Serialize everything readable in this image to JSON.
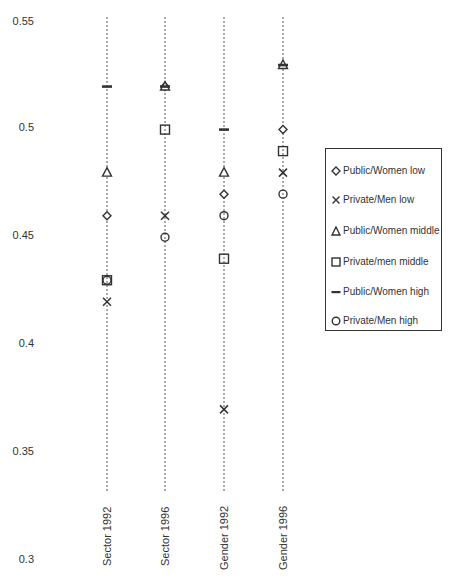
{
  "chart_data": {
    "type": "scatter",
    "title": "",
    "xlabel": "",
    "ylabel": "",
    "ylim": [
      0.3,
      0.55
    ],
    "yticks": [
      "0.55",
      "0.5",
      "0.45",
      "0.4",
      "0.35",
      "0.3"
    ],
    "grid": "vertical dashed lines per category",
    "legend_position": "right",
    "categories": [
      "Sector 1992",
      "Sector 1996",
      "Gender 1992",
      "Gender 1996"
    ],
    "series": [
      {
        "name": "Public/Women low",
        "marker": "diamond",
        "values": [
          0.46,
          0.52,
          0.47,
          0.5
        ]
      },
      {
        "name": "Private/Men low",
        "marker": "x",
        "values": [
          0.42,
          0.46,
          0.37,
          0.48
        ]
      },
      {
        "name": "Public/Women middle",
        "marker": "triangle",
        "values": [
          0.48,
          0.52,
          0.48,
          0.53
        ]
      },
      {
        "name": "Private/men middle",
        "marker": "square",
        "values": [
          0.43,
          0.5,
          0.44,
          0.49
        ]
      },
      {
        "name": "Public/Women high",
        "marker": "dash",
        "values": [
          0.52,
          0.52,
          0.5,
          0.53
        ]
      },
      {
        "name": "Private/Men high",
        "marker": "circle",
        "values": [
          0.43,
          0.45,
          0.46,
          0.47
        ]
      }
    ]
  },
  "axis": {
    "y_labels": [
      "0.55",
      "0.5",
      "0.45",
      "0.4",
      "0.35",
      "0.3"
    ],
    "x_labels": [
      "Sector 1992",
      "Sector 1996",
      "Gender 1992",
      "Gender 1996"
    ]
  },
  "legend": {
    "items": [
      {
        "label": "Public/Women low",
        "marker": "diamond"
      },
      {
        "label": "Private/Men low",
        "marker": "x"
      },
      {
        "label": "Public/Women middle",
        "marker": "triangle"
      },
      {
        "label": "Private/men middle",
        "marker": "square"
      },
      {
        "label": "Public/Women high",
        "marker": "dash"
      },
      {
        "label": "Private/Men high",
        "marker": "circle"
      }
    ]
  },
  "colors": {
    "ink": "#333333",
    "background": "#ffffff"
  }
}
